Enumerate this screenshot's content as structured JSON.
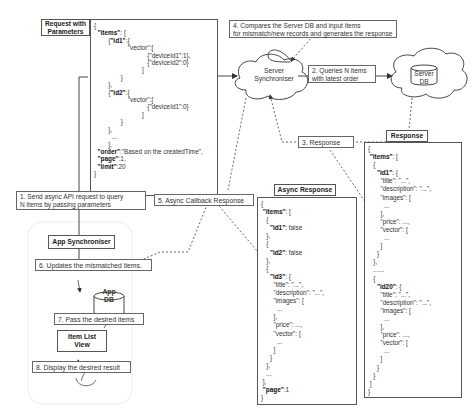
{
  "request": {
    "title_line1": "Request with",
    "title_line2": "Parameters",
    "code": [
      "{",
      "  \"items\": [",
      "        {\"id1\":{",
      "                   \"vector\":[",
      "                              {\"deviceId1\":1},",
      "                              {\"deviceId2\":0}",
      "                           ]",
      "               }",
      "        },",
      "        {\"id2\":{",
      "                   \"vector\":[",
      "                              {\"deviceId1\":0}",
      "                           ]",
      "               }",
      "        },",
      "          ...",
      "        ],",
      "  \"order\":\"Based on the createdTime\",",
      "  \"page\":1,",
      "  \"limit\":20",
      "}"
    ]
  },
  "server_sync": {
    "line1": "Server",
    "line2": "Synchroniser"
  },
  "server_db": {
    "line1": "Server",
    "line2": "DB"
  },
  "steps": {
    "step1": {
      "line1": "1. Send async API request to query",
      "line2": "N items by passing parameters"
    },
    "step2": {
      "line1": "2. Queries N items",
      "line2": "with latest order"
    },
    "step3": "3. Response",
    "step4": {
      "line1": "4. Compares the Server DB and input items",
      "line2": "for mismatch/new records and generates the response"
    },
    "step5": "5. Async Callback Response",
    "step6": "6. Updates the mismatched items.",
    "step7": "7. Pass the desired items",
    "step8": "8. Display the desired result"
  },
  "app": {
    "app_sync": "App Synchroniser",
    "app_db": {
      "line1": "App",
      "line2": "DB"
    },
    "item_list": {
      "line1": "Item List",
      "line2": "View"
    }
  },
  "response": {
    "title": "Response",
    "code": [
      "{",
      " \"items\": [",
      "   {",
      "     \"id1\": {",
      "       \"title\": \"...\",",
      "       \"description\": \"...\",",
      "       \"images\": [",
      "         ...",
      "       ],",
      "       \"price\": ...,",
      "       \"vector\": [",
      "         ...",
      "       ]",
      "     }",
      "   },",
      "   ......",
      "   {",
      "     \"id20\": {",
      "       \"title\": \"...\",",
      "       \"description\": \"...\",",
      "       \"images\": [",
      "         ...",
      "       ],",
      "       \"price\": ...,",
      "       \"vector\": [",
      "         ...",
      "       ]",
      "     }",
      "   }",
      " ]",
      "}"
    ]
  },
  "async_response": {
    "title": "Async Response",
    "code": [
      "{",
      " \"items\": [",
      "   {",
      "     \"id1\": false",
      "   },",
      "   {",
      "     \"id2\": false",
      "   },",
      "   {",
      "     \"id3\": {",
      "       \"title\": \"...\",",
      "       \"description\": \"...\",",
      "       \"images\": [",
      "         ...",
      "       ],",
      "       \"price\": ...,",
      "       \"vector\": [",
      "         ...",
      "       ]",
      "     }",
      "   },",
      "   ...",
      " ],",
      " \"page\":1",
      "}"
    ]
  }
}
